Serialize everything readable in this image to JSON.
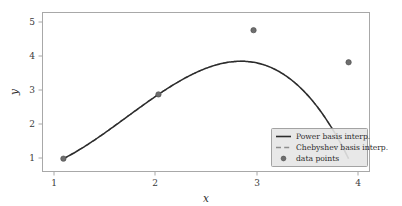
{
  "chart_data": {
    "type": "line",
    "title": "",
    "xlabel": "x",
    "ylabel": "y",
    "xlim": [
      0.78,
      4.22
    ],
    "ylim": [
      0.6,
      5.55
    ],
    "xticks": [
      1,
      2,
      3,
      4
    ],
    "xtick_labels": [
      "1",
      "2",
      "3",
      "4"
    ],
    "yticks": [
      1,
      2,
      3,
      4,
      5
    ],
    "ytick_labels": [
      "1",
      "2",
      "3",
      "4",
      "5"
    ],
    "grid": false,
    "legend_position": "lower right",
    "series": [
      {
        "name": "Power basis interp.",
        "style": "solid",
        "color": "#2c2c2c",
        "x": [
          1.0,
          1.15,
          1.3,
          1.45,
          1.6,
          1.75,
          1.9,
          2.05,
          2.2,
          2.35,
          2.5,
          2.65,
          2.8,
          2.95,
          3.1,
          3.25,
          3.4,
          3.55,
          3.7,
          3.85,
          4.0
        ],
        "values": [
          1.0,
          1.227,
          1.492,
          1.789,
          2.112,
          2.453,
          2.807,
          3.167,
          3.526,
          3.878,
          4.216,
          4.534,
          4.824,
          5.081,
          5.298,
          5.467,
          5.582,
          5.637,
          5.624,
          5.537,
          4.0
        ]
      },
      {
        "name": "Chebyshev basis interp.",
        "style": "dashed",
        "color": "#8d8d8d",
        "x": [
          1.0,
          1.15,
          1.3,
          1.45,
          1.6,
          1.75,
          1.9,
          2.05,
          2.2,
          2.35,
          2.5,
          2.65,
          2.8,
          2.95,
          3.1,
          3.25,
          3.4,
          3.55,
          3.7,
          3.85,
          4.0
        ],
        "values": [
          1.0,
          1.227,
          1.492,
          1.789,
          2.112,
          2.453,
          2.807,
          3.167,
          3.526,
          3.878,
          4.216,
          4.534,
          4.824,
          5.081,
          5.298,
          5.467,
          5.582,
          5.637,
          5.624,
          5.537,
          4.0
        ]
      },
      {
        "name": "data points",
        "style": "marker",
        "color": "#6e6e6e",
        "x": [
          1,
          2,
          3,
          4
        ],
        "values": [
          1,
          3,
          5,
          4
        ]
      }
    ],
    "polynomial": {
      "coefficients_power_basis": [
        1.0,
        -2.0,
        2.5,
        -0.5
      ],
      "description": "y = -0.5x^3 + 2.5x^2 - 2x + 1",
      "peak_x": 3.28,
      "peak_y": 5.17
    }
  },
  "legend": {
    "entries": [
      {
        "label": "Power basis interp.",
        "marker": "solid-line"
      },
      {
        "label": "Chebyshev basis interp.",
        "marker": "dashed-line"
      },
      {
        "label": "data points",
        "marker": "circle-dot"
      }
    ]
  },
  "axes": {
    "x_title": "x",
    "y_title": "y"
  }
}
